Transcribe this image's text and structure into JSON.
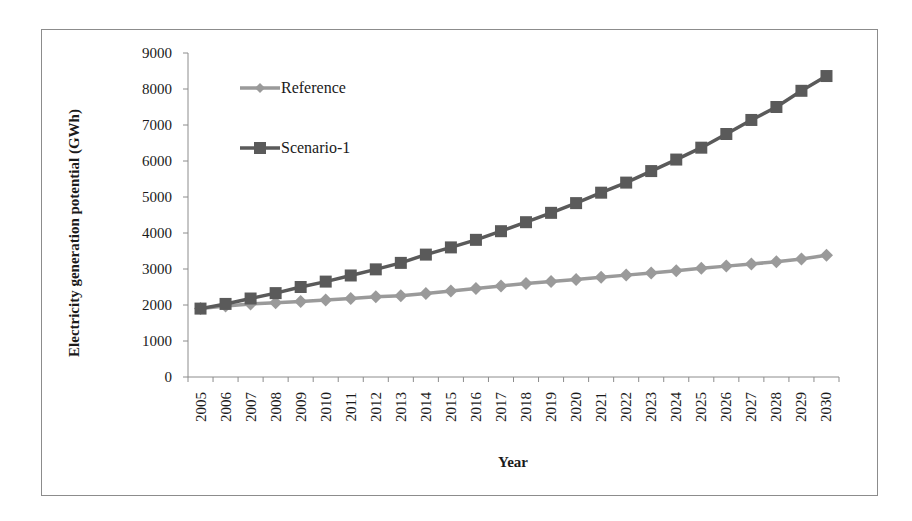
{
  "chart_data": {
    "type": "line",
    "title": "",
    "xlabel": "Year",
    "ylabel": "Electricity generation potential (GWh)",
    "ylim": [
      0,
      9000
    ],
    "yticks": [
      0,
      1000,
      2000,
      3000,
      4000,
      5000,
      6000,
      7000,
      8000,
      9000
    ],
    "grid": false,
    "legend_position": "upper-left-inside",
    "categories": [
      "2005",
      "2006",
      "2007",
      "2008",
      "2009",
      "2010",
      "2011",
      "2012",
      "2013",
      "2014",
      "2015",
      "2016",
      "2017",
      "2018",
      "2019",
      "2020",
      "2021",
      "2022",
      "2023",
      "2024",
      "2025",
      "2026",
      "2027",
      "2028",
      "2029",
      "2030"
    ],
    "series": [
      {
        "name": "Reference",
        "marker": "diamond",
        "color": "#9a9a9a",
        "values": [
          1900,
          1970,
          2030,
          2060,
          2100,
          2140,
          2180,
          2230,
          2260,
          2320,
          2390,
          2460,
          2530,
          2600,
          2650,
          2710,
          2770,
          2830,
          2890,
          2950,
          3020,
          3080,
          3140,
          3200,
          3280,
          3380
        ]
      },
      {
        "name": "Scenario-1",
        "marker": "square",
        "color": "#5a5a5a",
        "values": [
          1900,
          2030,
          2180,
          2330,
          2500,
          2650,
          2820,
          2990,
          3170,
          3400,
          3600,
          3810,
          4050,
          4300,
          4560,
          4830,
          5120,
          5400,
          5720,
          6040,
          6370,
          6750,
          7140,
          7500,
          7950,
          8360
        ]
      }
    ]
  }
}
